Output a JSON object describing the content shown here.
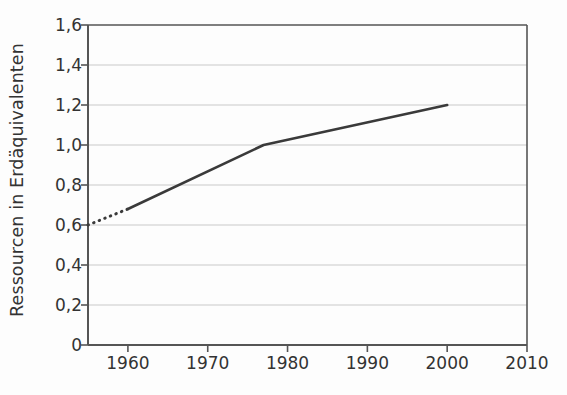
{
  "chart_data": {
    "type": "line",
    "title": "",
    "xlabel": "",
    "ylabel": "Ressourcen in Erdäquivalenten",
    "xlim": [
      1955,
      2010
    ],
    "ylim": [
      0,
      1.6
    ],
    "grid": "horizontal",
    "legend": "none",
    "x_ticks": [
      1960,
      1970,
      1980,
      1990,
      2000,
      2010
    ],
    "x_tick_labels": [
      "1960",
      "1970",
      "1980",
      "1990",
      "2000",
      "2010"
    ],
    "y_ticks": [
      0,
      0.2,
      0.4,
      0.6,
      0.8,
      1.0,
      1.2,
      1.4,
      1.6
    ],
    "y_tick_labels": [
      "0",
      "0,2",
      "0,4",
      "0,6",
      "0,8",
      "1,0",
      "1,2",
      "1,4",
      "1,6"
    ],
    "series": [
      {
        "name": "Ressourcenverbrauch (geschätzt)",
        "style": "dotted",
        "color": "#3a3a3a",
        "x": [
          1955,
          1960
        ],
        "y": [
          0.6,
          0.68
        ]
      },
      {
        "name": "Ressourcenverbrauch",
        "style": "solid",
        "color": "#3a3a3a",
        "x": [
          1960,
          1977,
          2000
        ],
        "y": [
          0.68,
          1.0,
          1.2
        ]
      }
    ]
  },
  "colors": {
    "line": "#3a3a3a",
    "grid": "#c9c9c9",
    "axis": "#555555",
    "text": "#333333",
    "background": "#fdfdfd"
  }
}
